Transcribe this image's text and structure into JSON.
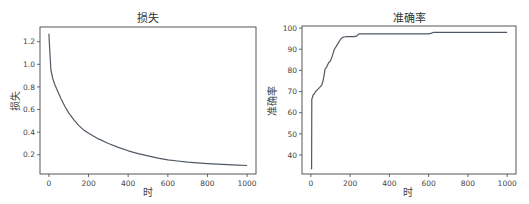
{
  "chart_data": [
    {
      "type": "line",
      "title": "损失",
      "xlabel": "时",
      "ylabel": "损失",
      "xlim": [
        -45,
        1045
      ],
      "ylim": [
        0.03,
        1.33
      ],
      "xticks": [
        0,
        200,
        400,
        600,
        800,
        1000
      ],
      "xtick_labels": [
        "0",
        "200",
        "400",
        "600",
        "800",
        "1000"
      ],
      "yticks": [
        0.2,
        0.4,
        0.6,
        0.8,
        1.0,
        1.2
      ],
      "ytick_labels": [
        "0.2",
        "0.4",
        "0.6",
        "0.8",
        "1.0",
        "1.2"
      ],
      "grid": false,
      "legend": null,
      "series": [
        {
          "name": "loss",
          "color": "#505a64",
          "x": [
            0,
            5,
            10,
            20,
            30,
            40,
            50,
            60,
            80,
            100,
            125,
            150,
            175,
            200,
            250,
            300,
            350,
            400,
            450,
            500,
            550,
            600,
            650,
            700,
            750,
            800,
            850,
            900,
            950,
            1000
          ],
          "y": [
            1.27,
            1.1,
            0.95,
            0.87,
            0.82,
            0.78,
            0.74,
            0.7,
            0.63,
            0.57,
            0.51,
            0.46,
            0.42,
            0.39,
            0.34,
            0.3,
            0.265,
            0.235,
            0.21,
            0.19,
            0.17,
            0.155,
            0.145,
            0.135,
            0.128,
            0.122,
            0.117,
            0.112,
            0.108,
            0.105
          ]
        }
      ]
    },
    {
      "type": "line",
      "title": "准确率",
      "xlabel": "时",
      "ylabel": "准确率",
      "xlim": [
        -45,
        1045
      ],
      "ylim": [
        31,
        101
      ],
      "xticks": [
        0,
        200,
        400,
        600,
        800,
        1000
      ],
      "xtick_labels": [
        "0",
        "200",
        "400",
        "600",
        "800",
        "1000"
      ],
      "yticks": [
        40,
        50,
        60,
        70,
        80,
        90,
        100
      ],
      "ytick_labels": [
        "40",
        "50",
        "60",
        "70",
        "80",
        "90",
        "100"
      ],
      "grid": false,
      "legend": null,
      "series": [
        {
          "name": "accuracy",
          "color": "#505a64",
          "x": [
            0,
            4,
            5,
            8,
            12,
            18,
            25,
            35,
            45,
            55,
            62,
            68,
            72,
            80,
            90,
            100,
            110,
            120,
            130,
            140,
            150,
            160,
            170,
            180,
            200,
            220,
            235,
            245,
            300,
            400,
            500,
            600,
            615,
            625,
            700,
            800,
            900,
            1000
          ],
          "y": [
            33.5,
            33.5,
            66.5,
            67,
            68.5,
            69,
            70,
            71,
            72,
            73,
            75,
            78,
            80.5,
            81.5,
            83.5,
            84.5,
            87,
            90,
            91.5,
            93,
            94.5,
            95.5,
            95.8,
            96,
            96,
            96,
            96.3,
            97.3,
            97.3,
            97.3,
            97.3,
            97.3,
            97.6,
            98,
            98,
            98,
            98,
            98
          ]
        }
      ]
    }
  ]
}
